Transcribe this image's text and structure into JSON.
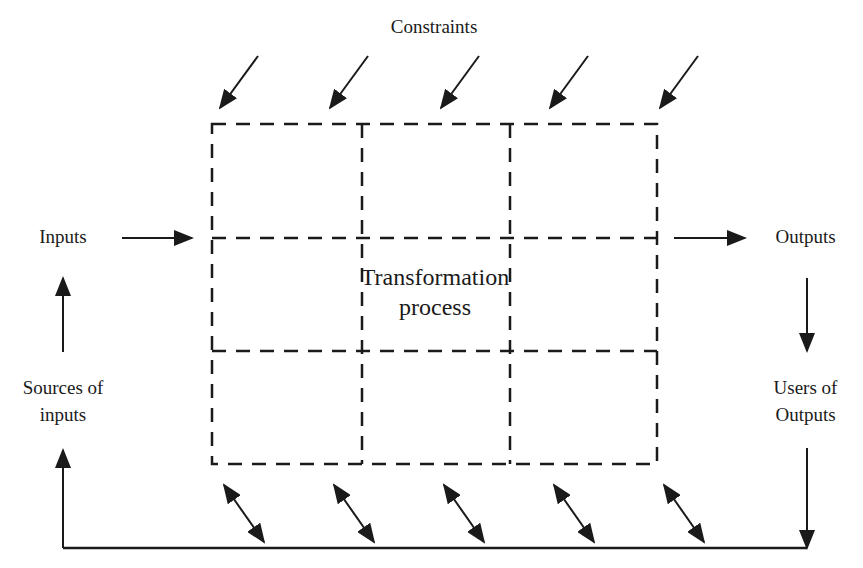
{
  "diagram": {
    "title_top": "Constraints",
    "center": {
      "line1": "Transformation",
      "line2": "process"
    },
    "left": {
      "inputs": "Inputs",
      "sources_line1": "Sources of",
      "sources_line2": "inputs"
    },
    "right": {
      "outputs": "Outputs",
      "users_line1": "Users of",
      "users_line2": "Outputs"
    },
    "grid": {
      "rows": 3,
      "cols": 3,
      "style": "dashed"
    },
    "arrows": {
      "constraints_count": 5,
      "constraints_direction": "down-left into process",
      "bottom_bidirectional_count": 5,
      "flow": [
        "Sources of inputs",
        "Inputs",
        "Transformation process",
        "Outputs",
        "Users of Outputs",
        "feedback loop back to Sources of inputs"
      ]
    },
    "colors": {
      "line": "#1a1a1a",
      "background": "#ffffff"
    }
  }
}
